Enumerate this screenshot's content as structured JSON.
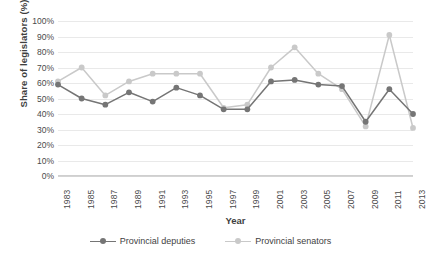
{
  "chart_data": {
    "type": "line",
    "title": "",
    "xlabel": "Year",
    "ylabel": "Share of legislators (%)",
    "x": [
      1983,
      1985,
      1987,
      1989,
      1991,
      1993,
      1995,
      1997,
      1999,
      2001,
      2003,
      2005,
      2007,
      2009,
      2011,
      2013
    ],
    "categories": [
      "1983",
      "1985",
      "1987",
      "1989",
      "1991",
      "1993",
      "1995",
      "1997",
      "1999",
      "2001",
      "2003",
      "2005",
      "2007",
      "2009",
      "2011",
      "2013"
    ],
    "ylim": [
      0,
      100
    ],
    "ytick_labels": [
      "0%",
      "10%",
      "20%",
      "30%",
      "40%",
      "50%",
      "60%",
      "70%",
      "80%",
      "90%",
      "100%"
    ],
    "ytick_values": [
      0,
      10,
      20,
      30,
      40,
      50,
      60,
      70,
      80,
      90,
      100
    ],
    "grid": true,
    "legend_position": "bottom",
    "series": [
      {
        "name": "Provincial deputies",
        "color": "#757575",
        "marker": "circle",
        "values": [
          59,
          50,
          46,
          54,
          48,
          57,
          52,
          43,
          43,
          61,
          62,
          59,
          58,
          35,
          56,
          40
        ]
      },
      {
        "name": "Provincial senators",
        "color": "#c9c9c9",
        "marker": "circle",
        "values": [
          61,
          70,
          52,
          61,
          66,
          66,
          66,
          44,
          46,
          70,
          83,
          66,
          56,
          32,
          91,
          31
        ]
      }
    ]
  },
  "legend": {
    "items": [
      {
        "label": "Provincial deputies"
      },
      {
        "label": "Provincial senators"
      }
    ]
  },
  "colors": {
    "deputies": "#757575",
    "senators": "#c9c9c9",
    "grid": "#e9e9e9",
    "axis": "#d4d4d4",
    "text": "#3f3f3f",
    "background": "#ffffff"
  }
}
